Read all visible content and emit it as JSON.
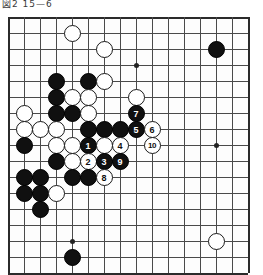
{
  "caption": {
    "text": "図2  15—6"
  },
  "board": {
    "name": "go-board",
    "columns": 15,
    "rows": 16,
    "cell_size": 16,
    "line_color": "#4a4a4a",
    "edge_color": "#2b2b2b",
    "background": "#fdfdfd",
    "star_points": [
      {
        "col": 8,
        "row": 3
      },
      {
        "col": 13,
        "row": 8
      },
      {
        "col": 4,
        "row": 14
      },
      {
        "col": 13,
        "row": 14
      }
    ],
    "stones": [
      {
        "col": 4,
        "row": 1,
        "color": "white",
        "label": ""
      },
      {
        "col": 6,
        "row": 2,
        "color": "white",
        "label": ""
      },
      {
        "col": 13,
        "row": 2,
        "color": "black",
        "label": ""
      },
      {
        "col": 3,
        "row": 4,
        "color": "black",
        "label": ""
      },
      {
        "col": 5,
        "row": 4,
        "color": "black",
        "label": ""
      },
      {
        "col": 6,
        "row": 4,
        "color": "white",
        "label": ""
      },
      {
        "col": 3,
        "row": 5,
        "color": "black",
        "label": ""
      },
      {
        "col": 4,
        "row": 5,
        "color": "white",
        "label": ""
      },
      {
        "col": 5,
        "row": 5,
        "color": "white",
        "label": ""
      },
      {
        "col": 8,
        "row": 5,
        "color": "white",
        "label": ""
      },
      {
        "col": 1,
        "row": 6,
        "color": "white",
        "label": ""
      },
      {
        "col": 3,
        "row": 6,
        "color": "black",
        "label": ""
      },
      {
        "col": 4,
        "row": 6,
        "color": "black",
        "label": ""
      },
      {
        "col": 5,
        "row": 6,
        "color": "white",
        "label": ""
      },
      {
        "col": 8,
        "row": 6,
        "color": "black",
        "label": "7"
      },
      {
        "col": 1,
        "row": 7,
        "color": "white",
        "label": ""
      },
      {
        "col": 2,
        "row": 7,
        "color": "white",
        "label": ""
      },
      {
        "col": 3,
        "row": 7,
        "color": "white",
        "label": ""
      },
      {
        "col": 5,
        "row": 7,
        "color": "black",
        "label": ""
      },
      {
        "col": 6,
        "row": 7,
        "color": "black",
        "label": ""
      },
      {
        "col": 7,
        "row": 7,
        "color": "black",
        "label": ""
      },
      {
        "col": 8,
        "row": 7,
        "color": "black",
        "label": "5"
      },
      {
        "col": 9,
        "row": 7,
        "color": "white",
        "label": "6"
      },
      {
        "col": 1,
        "row": 8,
        "color": "black",
        "label": ""
      },
      {
        "col": 3,
        "row": 8,
        "color": "white",
        "label": ""
      },
      {
        "col": 4,
        "row": 8,
        "color": "white",
        "label": ""
      },
      {
        "col": 5,
        "row": 8,
        "color": "black",
        "label": "1"
      },
      {
        "col": 6,
        "row": 8,
        "color": "white",
        "label": ""
      },
      {
        "col": 7,
        "row": 8,
        "color": "white",
        "label": "4"
      },
      {
        "col": 9,
        "row": 8,
        "color": "white",
        "label": "10"
      },
      {
        "col": 3,
        "row": 9,
        "color": "black",
        "label": ""
      },
      {
        "col": 4,
        "row": 9,
        "color": "white",
        "label": ""
      },
      {
        "col": 5,
        "row": 9,
        "color": "white",
        "label": "2"
      },
      {
        "col": 6,
        "row": 9,
        "color": "black",
        "label": "3"
      },
      {
        "col": 7,
        "row": 9,
        "color": "black",
        "label": "9"
      },
      {
        "col": 1,
        "row": 10,
        "color": "black",
        "label": ""
      },
      {
        "col": 2,
        "row": 10,
        "color": "black",
        "label": ""
      },
      {
        "col": 4,
        "row": 10,
        "color": "black",
        "label": ""
      },
      {
        "col": 5,
        "row": 10,
        "color": "black",
        "label": ""
      },
      {
        "col": 6,
        "row": 10,
        "color": "white",
        "label": "8"
      },
      {
        "col": 1,
        "row": 11,
        "color": "black",
        "label": ""
      },
      {
        "col": 2,
        "row": 11,
        "color": "black",
        "label": ""
      },
      {
        "col": 3,
        "row": 11,
        "color": "white",
        "label": ""
      },
      {
        "col": 2,
        "row": 12,
        "color": "black",
        "label": ""
      },
      {
        "col": 4,
        "row": 15,
        "color": "black",
        "label": ""
      },
      {
        "col": 13,
        "row": 14,
        "color": "white",
        "label": ""
      }
    ]
  }
}
